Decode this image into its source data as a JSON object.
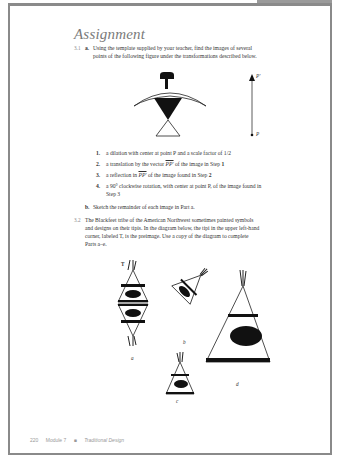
{
  "page": {
    "title": "Assignment",
    "problem_3_1": {
      "number": "3.1",
      "part_a_label": "a.",
      "part_a_text_line1": "Using the template supplied by your teacher, find the images of several",
      "part_a_text_line2": "points of the following figure under the transformations described below.",
      "figure_labels": {
        "p_prime": "P'",
        "p": "P"
      },
      "steps": [
        {
          "num": "1.",
          "text": "a dilation with center at point P and a scale factor of 1/2"
        },
        {
          "num": "2.",
          "text_before": "a translation by the vector ",
          "vector": "PP'",
          "text_after": " of the image in Step ",
          "ref": "1"
        },
        {
          "num": "3.",
          "text_before": "a reflection in ",
          "vector": "PP'",
          "text_after": " of the image found in Step ",
          "ref": "2"
        },
        {
          "num": "4.",
          "text_line1": "a 90° clockwise rotation, with center at point P, of the image found in",
          "text_line2": "Step 3"
        }
      ],
      "part_b_label": "b.",
      "part_b_text": "Sketch the remainder of each image in Part a."
    },
    "problem_3_2": {
      "number": "3.2",
      "lines": [
        "The Blackfeet tribe of the American Northwest sometimes painted symbols",
        "and designs on their tipis. In the diagram below, the tipi in the upper left-hand",
        "corner, labeled T, is the preimage. Use a copy of the diagram to complete",
        "Parts a–e."
      ],
      "tipi_labels": {
        "t": "T",
        "a": "a",
        "b": "b",
        "c": "c",
        "d": "d"
      }
    },
    "footer": {
      "page_number": "220",
      "module": "Module 7",
      "bullet": "■",
      "section": "Traditional Design"
    }
  }
}
